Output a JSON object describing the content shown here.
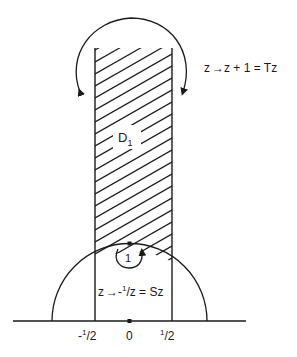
{
  "figure": {
    "type": "fundamental-domain-diagram",
    "region_label": "D",
    "region_subscript": "1",
    "translation_label": "z → z + 1 = Tz",
    "translation_parts": {
      "lhs": "z",
      "rhs": "z + 1 = Tz"
    },
    "inversion_parts": {
      "lhs": "z",
      "rhs_prefix": "-",
      "rhs_sup": "1",
      "rhs_rest": "/z = Sz"
    },
    "point_label_i": "1",
    "axis_ticks": [
      {
        "sign": "-",
        "num": "1",
        "den": "2",
        "value": -0.5
      },
      {
        "label": "0",
        "value": 0
      },
      {
        "sign": "",
        "num": "1",
        "den": "2",
        "value": 0.5
      }
    ],
    "colors": {
      "ink": "#1a1a1a",
      "background": "#ffffff"
    }
  }
}
